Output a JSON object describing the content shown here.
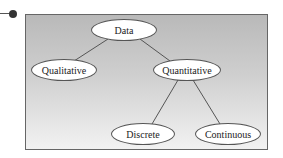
{
  "diagram": {
    "type": "tree",
    "nodes": [
      {
        "id": "data",
        "label": "Data"
      },
      {
        "id": "qualitative",
        "label": "Qualitative"
      },
      {
        "id": "quantitative",
        "label": "Quantitative"
      },
      {
        "id": "discrete",
        "label": "Discrete"
      },
      {
        "id": "continuous",
        "label": "Continuous"
      }
    ],
    "edges": [
      {
        "from": "data",
        "to": "qualitative"
      },
      {
        "from": "data",
        "to": "quantitative"
      },
      {
        "from": "quantitative",
        "to": "discrete"
      },
      {
        "from": "quantitative",
        "to": "continuous"
      }
    ],
    "colors": {
      "frame_top": "#b9b9b9",
      "frame_bottom": "#f2f2f2",
      "node_fill": "#ffffff",
      "line": "#555555"
    }
  }
}
